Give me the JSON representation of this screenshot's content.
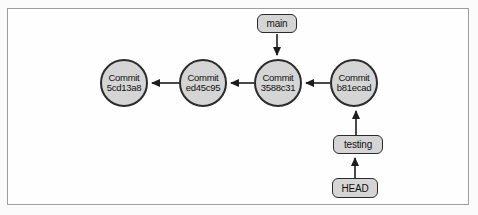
{
  "diagram": {
    "commits": [
      {
        "line1": "Commit",
        "line2": "5cd13a8"
      },
      {
        "line1": "Commit",
        "line2": "ed45c95"
      },
      {
        "line1": "Commit",
        "line2": "3588c31"
      },
      {
        "line1": "Commit",
        "line2": "b81ecad"
      }
    ],
    "refs": {
      "main": "main",
      "testing": "testing",
      "head": "HEAD"
    },
    "edges": [
      "main -> Commit 3588c31",
      "Commit b81ecad -> Commit 3588c31",
      "Commit 3588c31 -> Commit ed45c95",
      "Commit ed45c95 -> Commit 5cd13a8",
      "testing -> Commit b81ecad",
      "HEAD -> testing"
    ],
    "colors": {
      "node_fill": "#d5d5d5",
      "node_border": "#2b2b2b",
      "arrow": "#1c1c1c",
      "frame_border": "#9e9e9e",
      "background": "#fefefe"
    }
  }
}
